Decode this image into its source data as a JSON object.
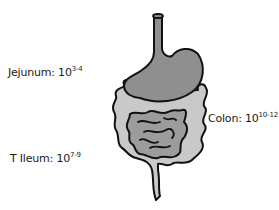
{
  "labels": {
    "jejunum": {
      "name": "Jejunum:",
      "base": "10",
      "exp": "3-4"
    },
    "ileum": {
      "name": "T Ileum:",
      "base": "10",
      "exp": "7-9"
    },
    "colon": {
      "name": "Colon:",
      "base": "10",
      "exp": "10-12"
    }
  },
  "colors": {
    "stomach": "#8f8f8f",
    "small_intestine": "#9c9c9c",
    "colon": "#c9c9c9",
    "outline": "#111111"
  }
}
